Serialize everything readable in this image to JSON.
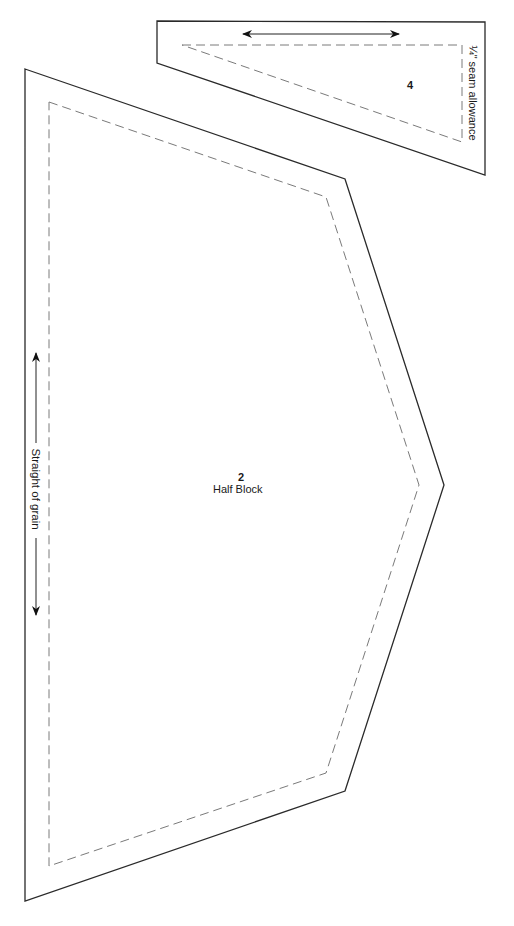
{
  "pattern_sheet": {
    "pieces": [
      {
        "id": "piece-2",
        "number": "2",
        "name": "Half Block",
        "grain_label": "Straight of grain"
      },
      {
        "id": "piece-4",
        "number": "4",
        "seam_label": "¼\" seam allowance"
      }
    ],
    "colors": {
      "outline": "#2a2a2a",
      "seam_line": "#7a7a7a",
      "background": "#ffffff"
    }
  }
}
